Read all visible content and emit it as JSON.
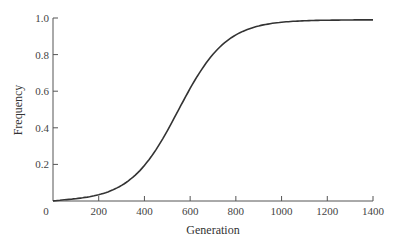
{
  "chart_data": {
    "type": "line",
    "title": "",
    "xlabel": "Generation",
    "ylabel": "Frequency",
    "xlim": [
      0,
      1400
    ],
    "ylim": [
      0,
      1.0
    ],
    "x_ticks": [
      0,
      200,
      400,
      600,
      800,
      1000,
      1200,
      1400
    ],
    "x_tick_labels": [
      "0",
      "200",
      "400",
      "600",
      "800",
      "1000",
      "1200",
      "1400"
    ],
    "y_ticks": [
      0.2,
      0.4,
      0.6,
      0.8,
      1.0
    ],
    "y_tick_labels": [
      "0.2",
      "0.4",
      "0.6",
      "0.8",
      "1.0"
    ],
    "grid": false,
    "legend": null,
    "series": [
      {
        "name": "Frequency",
        "color": "#333333",
        "x": [
          0,
          100,
          200,
          300,
          400,
          450,
          500,
          550,
          600,
          650,
          700,
          750,
          800,
          900,
          1000,
          1100,
          1200,
          1300,
          1400
        ],
        "values": [
          0.0,
          0.01,
          0.04,
          0.12,
          0.27,
          0.37,
          0.47,
          0.57,
          0.67,
          0.76,
          0.83,
          0.89,
          0.93,
          0.97,
          0.99,
          0.99,
          0.99,
          0.99,
          0.99
        ]
      }
    ]
  },
  "colors": {
    "axis": "#555555",
    "curve": "#333333",
    "background": "#ffffff"
  }
}
